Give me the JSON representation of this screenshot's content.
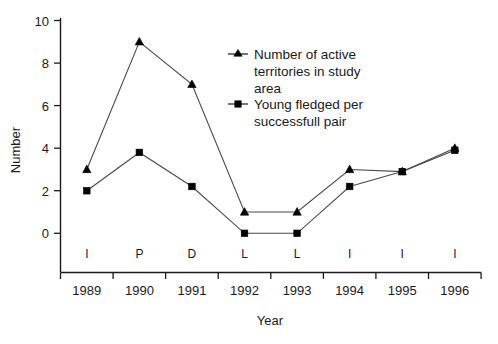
{
  "chart_data": {
    "type": "line",
    "title": "",
    "xlabel": "Year",
    "ylabel": "Number",
    "categories": [
      "1989",
      "1990",
      "1991",
      "1992",
      "1993",
      "1994",
      "1995",
      "1996"
    ],
    "category_codes": [
      "I",
      "P",
      "D",
      "L",
      "L",
      "I",
      "I",
      "I"
    ],
    "ylim": [
      0,
      10
    ],
    "yticks": [
      0,
      2,
      4,
      6,
      8,
      10
    ],
    "ytick_labels": [
      "0",
      "2",
      "4",
      "6",
      "8",
      "10"
    ],
    "grid": false,
    "legend_position": "upper-center-right",
    "series": [
      {
        "name": "Number of active territories in study area",
        "marker": "triangle",
        "values": [
          3,
          9,
          7,
          1,
          1,
          3,
          2.9,
          4
        ]
      },
      {
        "name": "Young fledged per successfull pair",
        "marker": "square",
        "values": [
          2,
          3.8,
          2.2,
          0,
          0,
          2.2,
          2.9,
          3.9
        ]
      }
    ]
  },
  "legend": {
    "entries": [
      {
        "marker": "triangle-marker",
        "lines": [
          "Number of active",
          "territories in study",
          "area"
        ]
      },
      {
        "marker": "square-marker",
        "lines": [
          "Young fledged per",
          "successfull pair"
        ]
      }
    ]
  },
  "colors": {
    "axis": "#1a1a1a",
    "line": "#4a4a4a",
    "marker": "#000000",
    "background": "#ffffff"
  }
}
